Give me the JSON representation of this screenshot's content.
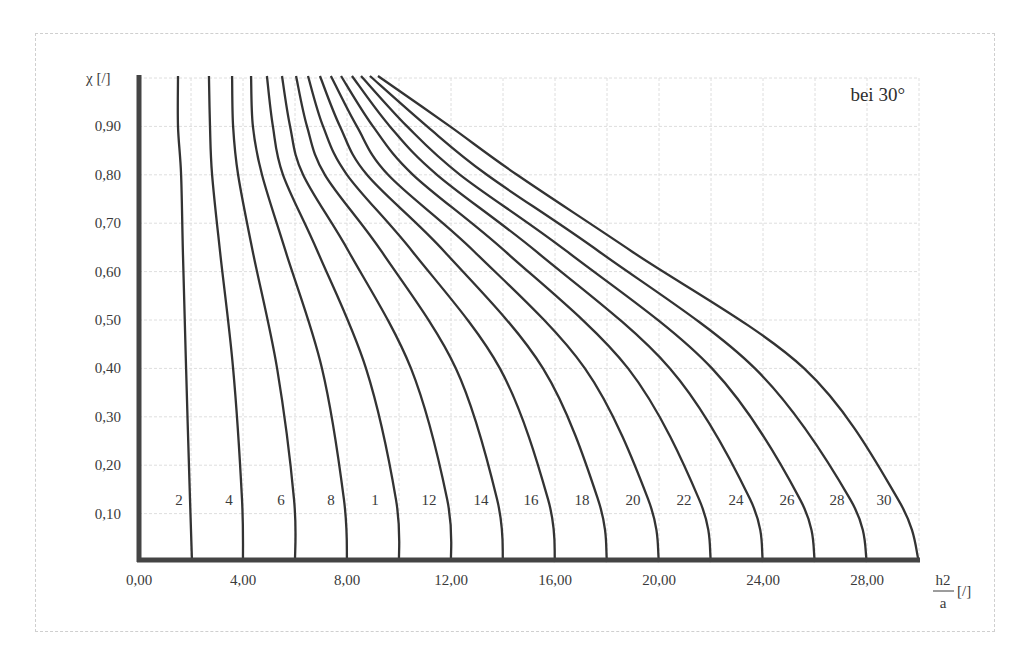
{
  "chart_data": {
    "type": "line",
    "title": "",
    "annotation": "bei 30°",
    "xlabel": "h2/a [/]",
    "xlabel_num": "h2",
    "xlabel_den": "a",
    "xlabel_unit": "[/]",
    "ylabel": "χ [/]",
    "xlim": [
      0,
      30
    ],
    "ylim": [
      0,
      1.0
    ],
    "grid": true,
    "x_ticks": [
      0,
      4,
      8,
      12,
      16,
      20,
      24,
      28
    ],
    "x_tick_labels": [
      "0,00",
      "4,00",
      "8,00",
      "12,00",
      "16,00",
      "20,00",
      "24,00",
      "28,00"
    ],
    "y_ticks": [
      0.1,
      0.2,
      0.3,
      0.4,
      0.5,
      0.6,
      0.7,
      0.8,
      0.9
    ],
    "y_tick_labels": [
      "0,10",
      "0,20",
      "0,30",
      "0,40",
      "0,50",
      "0,60",
      "0,70",
      "0,80",
      "0,90"
    ],
    "curve_labels": [
      "2",
      "4",
      "6",
      "8",
      "1",
      "12",
      "14",
      "16",
      "18",
      "20",
      "22",
      "24",
      "26",
      "28",
      "30"
    ],
    "series": [
      {
        "name": "2",
        "x": [
          1.5,
          1.5,
          1.62,
          1.69,
          1.81,
          1.96,
          2.04
        ],
        "y": [
          1.0,
          0.9,
          0.8,
          0.64,
          0.4,
          0.13,
          0.0
        ]
      },
      {
        "name": "4",
        "x": [
          2.69,
          2.73,
          2.81,
          3.12,
          3.62,
          3.96,
          4.0
        ],
        "y": [
          1.0,
          0.9,
          0.8,
          0.64,
          0.4,
          0.13,
          0.0
        ]
      },
      {
        "name": "6",
        "x": [
          3.58,
          3.62,
          3.81,
          4.38,
          5.31,
          5.96,
          6.0
        ],
        "y": [
          1.0,
          0.9,
          0.8,
          0.64,
          0.4,
          0.13,
          0.0
        ]
      },
      {
        "name": "8",
        "x": [
          4.31,
          4.38,
          4.73,
          5.65,
          7.04,
          7.88,
          8.0
        ],
        "y": [
          1.0,
          0.9,
          0.8,
          0.64,
          0.4,
          0.13,
          0.0
        ]
      },
      {
        "name": "10",
        "x": [
          4.92,
          5.15,
          5.54,
          6.88,
          8.73,
          9.88,
          10.0
        ],
        "y": [
          1.0,
          0.9,
          0.8,
          0.64,
          0.4,
          0.13,
          0.0
        ]
      },
      {
        "name": "12",
        "x": [
          5.5,
          5.81,
          6.31,
          8.08,
          10.46,
          11.85,
          12.0
        ],
        "y": [
          1.0,
          0.9,
          0.8,
          0.64,
          0.4,
          0.13,
          0.0
        ]
      },
      {
        "name": "14",
        "x": [
          6.04,
          6.46,
          7.15,
          9.35,
          12.19,
          13.77,
          14.0
        ],
        "y": [
          1.0,
          0.9,
          0.8,
          0.64,
          0.4,
          0.13,
          0.0
        ]
      },
      {
        "name": "16",
        "x": [
          6.5,
          7.08,
          8.0,
          10.54,
          13.88,
          15.73,
          16.0
        ],
        "y": [
          1.0,
          0.9,
          0.8,
          0.64,
          0.4,
          0.13,
          0.0
        ]
      },
      {
        "name": "18",
        "x": [
          6.96,
          7.73,
          8.77,
          11.77,
          15.54,
          17.65,
          18.0
        ],
        "y": [
          1.0,
          0.9,
          0.8,
          0.64,
          0.4,
          0.13,
          0.0
        ]
      },
      {
        "name": "20",
        "x": [
          7.38,
          8.38,
          9.58,
          12.92,
          17.15,
          19.58,
          20.0
        ],
        "y": [
          1.0,
          0.9,
          0.8,
          0.64,
          0.4,
          0.13,
          0.0
        ]
      },
      {
        "name": "22",
        "x": [
          7.77,
          9.0,
          10.54,
          14.12,
          18.81,
          21.54,
          22.0
        ],
        "y": [
          1.0,
          0.9,
          0.8,
          0.64,
          0.4,
          0.13,
          0.0
        ]
      },
      {
        "name": "24",
        "x": [
          8.19,
          9.65,
          11.46,
          15.31,
          20.42,
          23.5,
          24.0
        ],
        "y": [
          1.0,
          0.9,
          0.8,
          0.64,
          0.4,
          0.13,
          0.0
        ]
      },
      {
        "name": "26",
        "x": [
          8.54,
          10.31,
          12.35,
          16.5,
          22.04,
          25.42,
          26.0
        ],
        "y": [
          1.0,
          0.9,
          0.8,
          0.64,
          0.4,
          0.13,
          0.0
        ]
      },
      {
        "name": "28",
        "x": [
          8.88,
          11.08,
          13.38,
          17.73,
          23.69,
          27.35,
          28.0
        ],
        "y": [
          1.0,
          0.9,
          0.8,
          0.64,
          0.4,
          0.13,
          0.0
        ]
      },
      {
        "name": "30",
        "x": [
          9.19,
          11.96,
          14.54,
          19.0,
          25.58,
          29.19,
          30.0
        ],
        "y": [
          1.0,
          0.9,
          0.8,
          0.64,
          0.4,
          0.13,
          0.0
        ]
      }
    ],
    "legend": "none (curves labeled inline near bottom)"
  }
}
